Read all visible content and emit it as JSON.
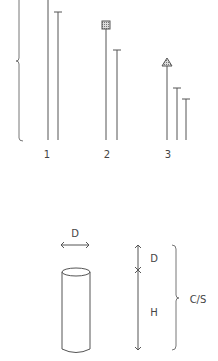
{
  "top_panel": {
    "groups": [
      {
        "label": "1",
        "lines": [
          {
            "x": 48,
            "top": 0,
            "cap": "none"
          },
          {
            "x": 58,
            "top": 12,
            "cap": "tee"
          }
        ]
      },
      {
        "label": "2",
        "lines": [
          {
            "x": 106,
            "top": 25,
            "cap": "hatched-square"
          },
          {
            "x": 117,
            "top": 50,
            "cap": "tee"
          }
        ]
      },
      {
        "label": "3",
        "lines": [
          {
            "x": 167,
            "top": 62,
            "cap": "triangle"
          },
          {
            "x": 177,
            "top": 88,
            "cap": "tee"
          },
          {
            "x": 186,
            "top": 99,
            "cap": "tee"
          }
        ]
      }
    ],
    "baseline_y": 140,
    "left_brace": {
      "x": 19,
      "top": 0,
      "bottom": 140,
      "cusp_y": 61
    }
  },
  "bottom_panel": {
    "diameter_label": "D",
    "segment_labels": {
      "top": "D",
      "bottom": "H"
    },
    "brace_label": "C/S",
    "shape": "cylinder"
  },
  "colors": {
    "stroke": "#555555",
    "hatch": "#888888",
    "background": "#ffffff"
  }
}
